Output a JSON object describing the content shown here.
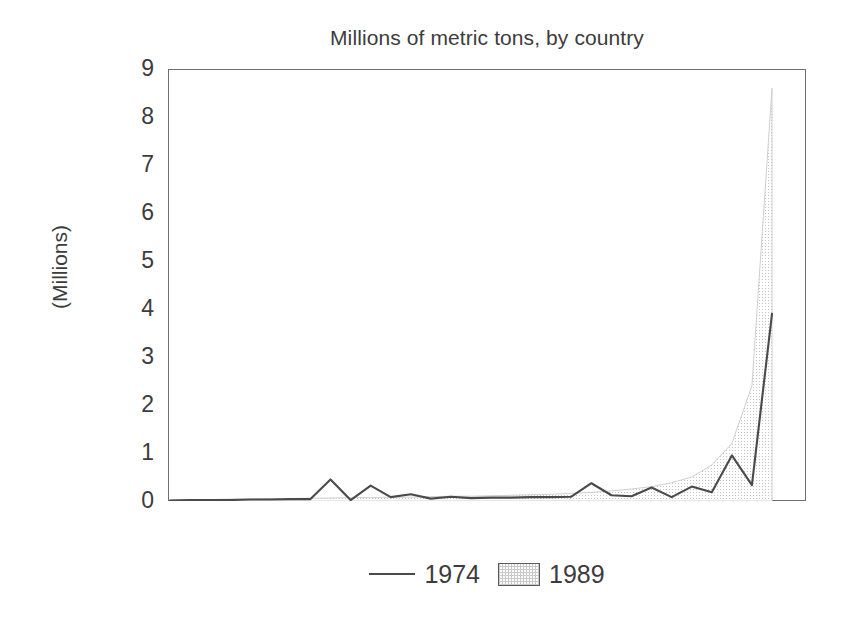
{
  "chart_data": {
    "type": "area",
    "title": "Millions of metric tons, by country",
    "xlabel": "",
    "ylabel": "(Millions)",
    "ylim": [
      0,
      9
    ],
    "ytick_labels": [
      "9",
      "8",
      "7",
      "6",
      "5",
      "4",
      "3",
      "2",
      "1",
      "0"
    ],
    "ytick_values": [
      9,
      8,
      7,
      6,
      5,
      4,
      3,
      2,
      1,
      0
    ],
    "grid": false,
    "legend_position": "bottom",
    "x": [
      1,
      2,
      3,
      4,
      5,
      6,
      7,
      8,
      9,
      10,
      11,
      12,
      13,
      14,
      15,
      16,
      17,
      18,
      19,
      20,
      21,
      22,
      23,
      24,
      25,
      26,
      27,
      28,
      29,
      30,
      31
    ],
    "series": [
      {
        "name": "1989",
        "style": "shaded-area",
        "color": "#e8e8e8",
        "values": [
          0.02,
          0.03,
          0.03,
          0.04,
          0.04,
          0.05,
          0.05,
          0.06,
          0.06,
          0.07,
          0.07,
          0.08,
          0.08,
          0.09,
          0.1,
          0.1,
          0.11,
          0.12,
          0.13,
          0.14,
          0.16,
          0.18,
          0.21,
          0.25,
          0.3,
          0.38,
          0.5,
          0.75,
          1.2,
          2.4,
          8.6
        ]
      },
      {
        "name": "1974",
        "style": "line",
        "color": "#4a4a4a",
        "values": [
          0.01,
          0.02,
          0.02,
          0.02,
          0.03,
          0.03,
          0.04,
          0.04,
          0.45,
          0.02,
          0.32,
          0.08,
          0.14,
          0.05,
          0.09,
          0.06,
          0.07,
          0.07,
          0.08,
          0.08,
          0.09,
          0.37,
          0.12,
          0.1,
          0.28,
          0.08,
          0.3,
          0.18,
          0.95,
          0.33,
          3.9
        ]
      }
    ]
  },
  "legend": {
    "entries": [
      {
        "label": "1974",
        "marker": "line-marker"
      },
      {
        "label": "1989",
        "marker": "swatch-marker"
      }
    ]
  }
}
